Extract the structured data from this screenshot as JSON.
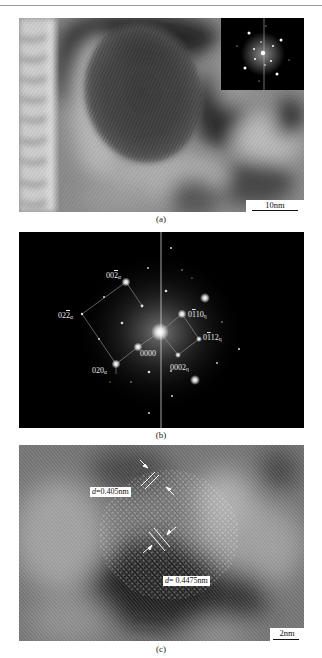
{
  "figure": {
    "panels": [
      {
        "id": "a",
        "caption": "(a)",
        "type": "HRTEM image with FFT inset",
        "scale_bar": "10nm",
        "inset": "FFT diffraction pattern"
      },
      {
        "id": "b",
        "caption": "(b)",
        "type": "FFT diffraction pattern",
        "spot_labels": [
          {
            "base": "002",
            "overline": "2",
            "prefix": "00",
            "sub": "α",
            "text": "002̄α"
          },
          {
            "base": "022",
            "prefix": "02",
            "overline": "2",
            "sub": "α",
            "text": "022̄α"
          },
          {
            "base": "020",
            "prefix": "020",
            "overline": "",
            "sub": "α",
            "text": "020α"
          },
          {
            "base": "0000",
            "prefix": "0000",
            "overline": "",
            "sub": "",
            "text": "0000"
          },
          {
            "base": "0110",
            "prefix": "0",
            "overline": "1",
            "suffix": "10",
            "sub": "η",
            "text": "01̄10η"
          },
          {
            "base": "0112",
            "prefix": "0",
            "overline": "1",
            "suffix": "12",
            "sub": "η",
            "text": "01̄12η"
          },
          {
            "base": "0002",
            "prefix": "0002",
            "overline": "",
            "sub": "η",
            "text": "0002η"
          }
        ]
      },
      {
        "id": "c",
        "caption": "(c)",
        "type": "HRTEM lattice image",
        "scale_bar": "2nm",
        "d_spacings": [
          {
            "symbol": "d",
            "value": "=0.405nm"
          },
          {
            "symbol": "d",
            "value": "= 0.4475nm"
          }
        ]
      }
    ]
  },
  "labels": {
    "a": "(a)",
    "b": "(b)",
    "c": "(c)",
    "scale_a": "10nm",
    "scale_c": "2nm",
    "d1_sym": "d",
    "d1_val": "=0.405nm",
    "d2_sym": "d",
    "d2_val": "= 0.4475nm",
    "idx_002a_pre": "00",
    "idx_002a_ov": "2",
    "idx_002a_sub": "α",
    "idx_022a_pre": "02",
    "idx_022a_ov": "2",
    "idx_022a_sub": "α",
    "idx_020a_pre": "020",
    "idx_020a_sub": "α",
    "idx_0000": "0000",
    "idx_0110_pre": "0",
    "idx_0110_ov": "1",
    "idx_0110_post": "10",
    "idx_0110_sub": "η",
    "idx_0112_pre": "0",
    "idx_0112_ov": "1",
    "idx_0112_post": "12",
    "idx_0112_sub": "η",
    "idx_0002_pre": "0002",
    "idx_0002_sub": "η"
  },
  "colors": {
    "page_bg": "#ffffff",
    "fft_bg": "#000000",
    "label_text": "#e8e8e8"
  }
}
